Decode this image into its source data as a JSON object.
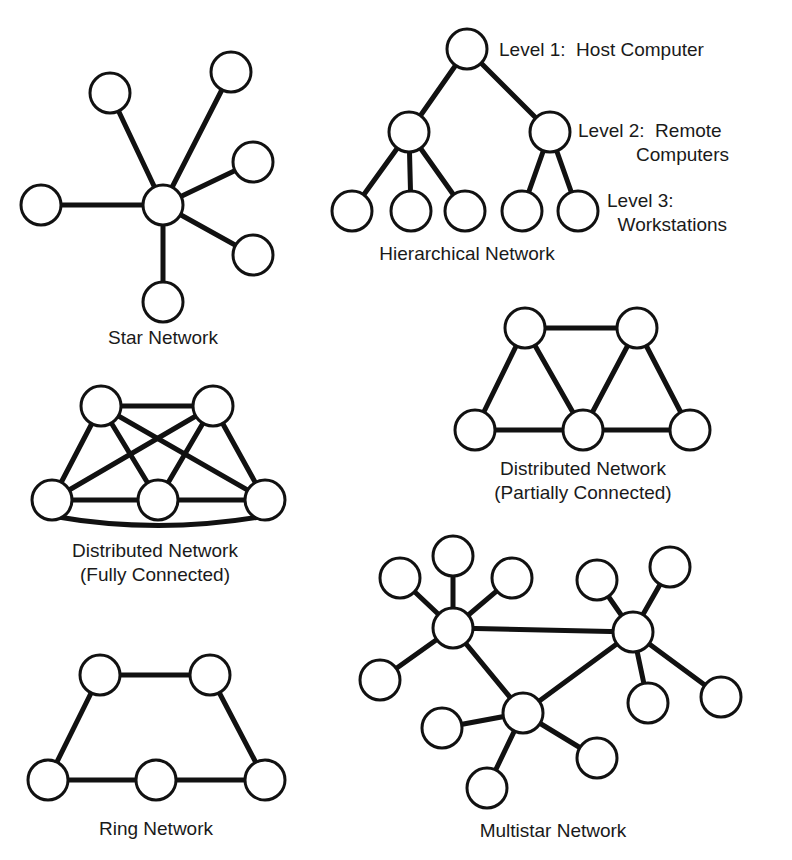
{
  "diagrams": {
    "star": {
      "caption": "Star Network",
      "caption_pos": [
        163,
        344
      ],
      "nodes": [
        [
          163,
          205
        ],
        [
          41,
          205
        ],
        [
          110,
          93
        ],
        [
          231,
          72
        ],
        [
          253,
          162
        ],
        [
          253,
          255
        ],
        [
          163,
          302
        ]
      ],
      "edges": [
        [
          0,
          1
        ],
        [
          0,
          2
        ],
        [
          0,
          3
        ],
        [
          0,
          4
        ],
        [
          0,
          5
        ],
        [
          0,
          6
        ]
      ]
    },
    "hierarchical": {
      "caption": "Hierarchical Network",
      "caption_pos": [
        467,
        260
      ],
      "nodes": [
        [
          467,
          49
        ],
        [
          409,
          132
        ],
        [
          550,
          132
        ],
        [
          352,
          211
        ],
        [
          411,
          211
        ],
        [
          465,
          211
        ],
        [
          522,
          211
        ],
        [
          578,
          211
        ]
      ],
      "edges": [
        [
          0,
          1
        ],
        [
          0,
          2
        ],
        [
          1,
          3
        ],
        [
          1,
          4
        ],
        [
          1,
          5
        ],
        [
          2,
          6
        ],
        [
          2,
          7
        ]
      ],
      "level_labels": [
        {
          "lines": [
            "Level 1:  Host Computer"
          ],
          "pos": [
            499,
            49
          ]
        },
        {
          "lines": [
            "Level 2:  Remote",
            "           Computers"
          ],
          "pos": [
            578,
            130
          ]
        },
        {
          "lines": [
            "Level 3:",
            "  Workstations"
          ],
          "pos": [
            607,
            200
          ]
        }
      ]
    },
    "fully_connected": {
      "caption_lines": [
        "Distributed Network",
        "(Fully Connected)"
      ],
      "caption_pos": [
        155,
        557
      ],
      "nodes": [
        [
          101,
          406
        ],
        [
          213,
          406
        ],
        [
          52,
          500
        ],
        [
          158,
          500
        ],
        [
          265,
          500
        ]
      ],
      "edges": [
        [
          0,
          1
        ],
        [
          0,
          2
        ],
        [
          0,
          3
        ],
        [
          0,
          4
        ],
        [
          1,
          2
        ],
        [
          1,
          3
        ],
        [
          1,
          4
        ],
        [
          2,
          3
        ],
        [
          3,
          4
        ]
      ],
      "curved_edge": [
        2,
        4
      ]
    },
    "partially_connected": {
      "caption_lines": [
        "Distributed Network",
        "(Partially Connected)"
      ],
      "caption_pos": [
        583,
        475
      ],
      "nodes": [
        [
          525,
          328
        ],
        [
          637,
          328
        ],
        [
          475,
          430
        ],
        [
          583,
          430
        ],
        [
          690,
          430
        ]
      ],
      "edges": [
        [
          0,
          1
        ],
        [
          0,
          2
        ],
        [
          0,
          3
        ],
        [
          1,
          3
        ],
        [
          1,
          4
        ],
        [
          2,
          3
        ],
        [
          3,
          4
        ]
      ]
    },
    "ring": {
      "caption": "Ring Network",
      "caption_pos": [
        156,
        835
      ],
      "nodes": [
        [
          100,
          675
        ],
        [
          210,
          675
        ],
        [
          48,
          780
        ],
        [
          156,
          780
        ],
        [
          265,
          780
        ]
      ],
      "edges": [
        [
          0,
          1
        ],
        [
          0,
          2
        ],
        [
          1,
          4
        ],
        [
          2,
          3
        ],
        [
          3,
          4
        ]
      ]
    },
    "multistar": {
      "caption": "Multistar Network",
      "caption_pos": [
        553,
        837
      ],
      "nodes": [
        [
          453,
          628
        ],
        [
          633,
          632
        ],
        [
          523,
          713
        ],
        [
          400,
          578
        ],
        [
          453,
          556
        ],
        [
          512,
          578
        ],
        [
          380,
          680
        ],
        [
          597,
          580
        ],
        [
          670,
          567
        ],
        [
          648,
          703
        ],
        [
          721,
          697
        ],
        [
          442,
          728
        ],
        [
          597,
          758
        ],
        [
          487,
          788
        ]
      ],
      "edges": [
        [
          0,
          1
        ],
        [
          0,
          2
        ],
        [
          1,
          2
        ],
        [
          0,
          3
        ],
        [
          0,
          4
        ],
        [
          0,
          5
        ],
        [
          0,
          6
        ],
        [
          1,
          7
        ],
        [
          1,
          8
        ],
        [
          1,
          9
        ],
        [
          1,
          10
        ],
        [
          2,
          11
        ],
        [
          2,
          12
        ],
        [
          2,
          13
        ]
      ]
    }
  },
  "style": {
    "node_radius": 20,
    "stroke_color": "#111111",
    "background": "#ffffff"
  }
}
